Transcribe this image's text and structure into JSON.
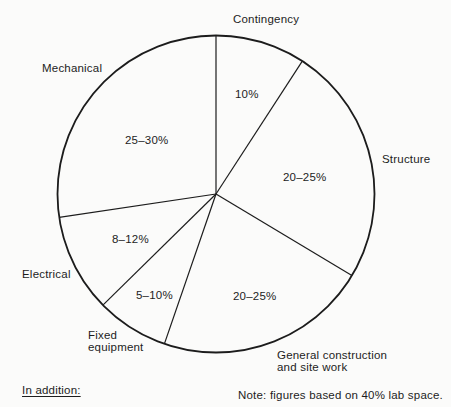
{
  "chart_data": {
    "type": "pie",
    "title": "",
    "angle_reference": "degrees clockwise from 12 o'clock",
    "fill": "none",
    "stroke_color": "#1c1c1c",
    "slices": [
      {
        "label": "Contingency",
        "value_label": "10%",
        "value_range_pct": [
          10,
          10
        ],
        "start_angle_deg": 0,
        "end_angle_deg": 33
      },
      {
        "label": "Structure",
        "value_label": "20–25%",
        "value_range_pct": [
          20,
          25
        ],
        "start_angle_deg": 33,
        "end_angle_deg": 121
      },
      {
        "label": "General construction and site work",
        "label_lines": [
          "General construction",
          "and site work"
        ],
        "value_label": "20–25%",
        "value_range_pct": [
          20,
          25
        ],
        "start_angle_deg": 121,
        "end_angle_deg": 199
      },
      {
        "label": "Fixed equipment",
        "label_lines": [
          "Fixed",
          "equipment"
        ],
        "value_label": "5–10%",
        "value_range_pct": [
          5,
          10
        ],
        "start_angle_deg": 199,
        "end_angle_deg": 225.5
      },
      {
        "label": "Electrical",
        "value_label": "8–12%",
        "value_range_pct": [
          8,
          12
        ],
        "start_angle_deg": 225.5,
        "end_angle_deg": 261.5
      },
      {
        "label": "Mechanical",
        "value_label": "25–30%",
        "value_range_pct": [
          25,
          30
        ],
        "start_angle_deg": 261.5,
        "end_angle_deg": 360
      }
    ]
  },
  "footer": {
    "in_addition": "In addition:",
    "note": "Note: figures based on 40% lab space."
  }
}
